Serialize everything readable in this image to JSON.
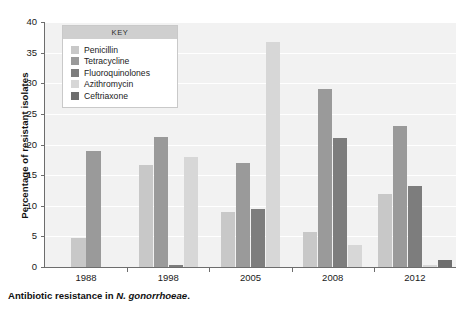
{
  "chart_data": {
    "type": "bar",
    "title": "",
    "xlabel": "",
    "ylabel": "Percentage of resistant isolates",
    "categories": [
      "1988",
      "1998",
      "2005",
      "2008",
      "2012"
    ],
    "ylim": [
      0,
      40
    ],
    "yticks": [
      0,
      5,
      10,
      15,
      20,
      25,
      30,
      35,
      40
    ],
    "grid": true,
    "legend_position": "inside-top-left",
    "legend_title": "KEY",
    "series": [
      {
        "name": "Penicillin",
        "color": "#c8c8c8",
        "values": [
          4.8,
          16.6,
          9.0,
          5.7,
          12.0
        ]
      },
      {
        "name": "Tetracycline",
        "color": "#9a9a9a",
        "values": [
          19.0,
          21.3,
          17.0,
          29.0,
          23.0
        ]
      },
      {
        "name": "Fluoroquinolones",
        "color": "#7d7d7d",
        "values": [
          0,
          0.3,
          9.4,
          21.0,
          13.3
        ]
      },
      {
        "name": "Azithromycin",
        "color": "#d7d7d7",
        "values": [
          0,
          18.0,
          36.8,
          3.6,
          0.4
        ]
      },
      {
        "name": "Ceftriaxone",
        "color": "#6e6e6e",
        "values": [
          0,
          0,
          0,
          0,
          1.1
        ]
      }
    ]
  },
  "caption": {
    "prefix": "Antibiotic resistance in ",
    "species": "N. gonorrhoeae",
    "suffix": "."
  }
}
